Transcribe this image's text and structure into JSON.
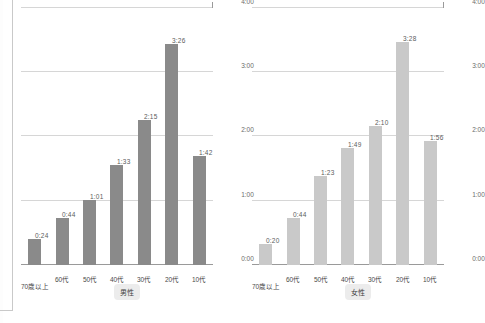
{
  "chart_data": [
    {
      "type": "bar",
      "title": "男性",
      "orientation": "horizontal",
      "categories": [
        "10代",
        "20代",
        "30代",
        "40代",
        "50代",
        "60代",
        "70歳以上"
      ],
      "values": [
        "1:42",
        "3:26",
        "2:15",
        "1:33",
        "1:01",
        "0:44",
        "0:24"
      ],
      "values_minutes": [
        102,
        206,
        135,
        93,
        61,
        44,
        24
      ],
      "xlabel": "",
      "ylabel": "",
      "xticks": [
        "0:00",
        "1:00",
        "2:00",
        "3:00",
        "4:00"
      ],
      "xlim": [
        "0:00",
        "4:00"
      ],
      "grid": true,
      "legend": "none",
      "bar_color": "#8a8a8a"
    },
    {
      "type": "bar",
      "title": "女性",
      "orientation": "horizontal",
      "categories": [
        "10代",
        "20代",
        "30代",
        "40代",
        "50代",
        "60代",
        "70歳以上"
      ],
      "values": [
        "1:56",
        "3:28",
        "2:10",
        "1:49",
        "1:23",
        "0:44",
        "0:20"
      ],
      "values_minutes": [
        116,
        208,
        130,
        109,
        83,
        44,
        20
      ],
      "xlabel": "",
      "ylabel": "",
      "xticks": [
        "0:00",
        "1:00",
        "2:00",
        "3:00",
        "4:00"
      ],
      "xlim": [
        "0:00",
        "4:00"
      ],
      "grid": true,
      "legend": "none",
      "bar_color": "#c9c9c9"
    }
  ]
}
